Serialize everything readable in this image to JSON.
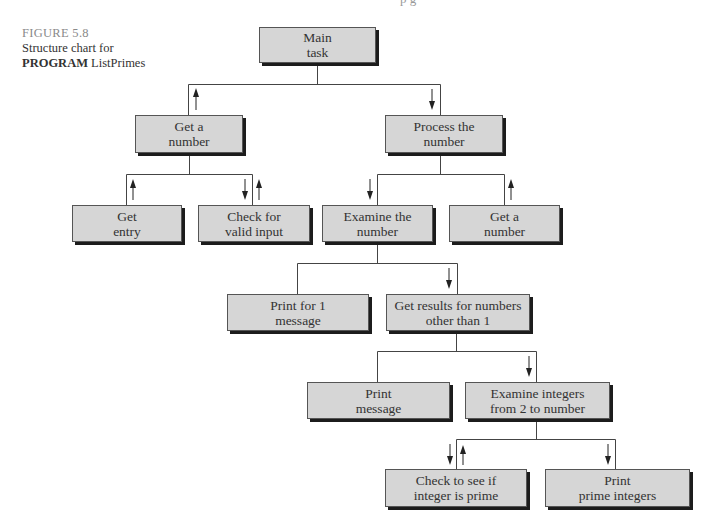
{
  "caption": {
    "figure_number": "FIGURE 5.8",
    "line1": "Structure chart for",
    "program_keyword": "PROGRAM",
    "program_name": "ListPrimes"
  },
  "top_cut_text": "p          g",
  "diagram": {
    "type": "structure-chart",
    "nodes": [
      {
        "id": "main",
        "label": "Main\ntask",
        "level": 0
      },
      {
        "id": "get_number_1",
        "label": "Get a\nnumber",
        "level": 1,
        "parent": "main"
      },
      {
        "id": "process",
        "label": "Process the\nnumber",
        "level": 1,
        "parent": "main"
      },
      {
        "id": "get_entry",
        "label": "Get\nentry",
        "level": 2,
        "parent": "get_number_1"
      },
      {
        "id": "check_valid",
        "label": "Check for\nvalid input",
        "level": 2,
        "parent": "get_number_1"
      },
      {
        "id": "examine",
        "label": "Examine the\nnumber",
        "level": 2,
        "parent": "process"
      },
      {
        "id": "get_number_2",
        "label": "Get a\nnumber",
        "level": 2,
        "parent": "process"
      },
      {
        "id": "print_for_1",
        "label": "Print for 1\nmessage",
        "level": 3,
        "parent": "examine"
      },
      {
        "id": "get_results",
        "label": "Get results for numbers\nother than 1",
        "level": 3,
        "parent": "examine"
      },
      {
        "id": "print_message",
        "label": "Print\nmessage",
        "level": 4,
        "parent": "get_results"
      },
      {
        "id": "examine_integers",
        "label": "Examine integers\nfrom 2 to number",
        "level": 4,
        "parent": "get_results"
      },
      {
        "id": "check_prime",
        "label": "Check to see if\ninteger is prime",
        "level": 5,
        "parent": "examine_integers"
      },
      {
        "id": "print_primes",
        "label": "Print\nprime integers",
        "level": 5,
        "parent": "examine_integers"
      }
    ],
    "data_flow_arrows": [
      {
        "edge": "main-get_number_1",
        "directions": [
          "up"
        ]
      },
      {
        "edge": "main-process",
        "directions": [
          "down"
        ]
      },
      {
        "edge": "get_number_1-get_entry",
        "directions": [
          "up"
        ]
      },
      {
        "edge": "get_number_1-check_valid",
        "directions": [
          "down",
          "up"
        ]
      },
      {
        "edge": "process-examine",
        "directions": [
          "down"
        ]
      },
      {
        "edge": "process-get_number_2",
        "directions": [
          "up"
        ]
      },
      {
        "edge": "examine-get_results",
        "directions": [
          "down"
        ]
      },
      {
        "edge": "get_results-examine_integers",
        "directions": [
          "down"
        ]
      },
      {
        "edge": "examine_integers-check_prime",
        "directions": [
          "down",
          "up"
        ]
      },
      {
        "edge": "examine_integers-print_primes",
        "directions": [
          "down"
        ]
      }
    ]
  },
  "boxes": {
    "main": "Main\ntask",
    "get_number_1": "Get a\nnumber",
    "process": "Process the\nnumber",
    "get_entry": "Get\nentry",
    "check_valid": "Check for\nvalid input",
    "examine": "Examine the\nnumber",
    "get_number_2": "Get a\nnumber",
    "print_for_1": "Print for 1\nmessage",
    "get_results": "Get results for numbers\nother than 1",
    "print_message": "Print\nmessage",
    "examine_integers": "Examine integers\nfrom 2 to number",
    "check_prime": "Check to see if\ninteger is prime",
    "print_primes": "Print\nprime integers"
  },
  "colors": {
    "box_fill": "#d6d6d6",
    "box_border": "#555555",
    "box_shadow": "#1c1c1c",
    "line": "#444444",
    "caption_figure": "#8a8a8a"
  }
}
